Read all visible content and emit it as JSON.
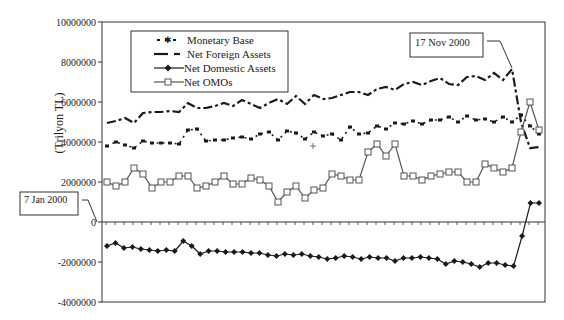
{
  "chart_data": {
    "type": "line",
    "title": "",
    "xlabel": "",
    "ylabel": "(Trilyon TL)",
    "ylim": [
      -4000000,
      10000000
    ],
    "y_ticks": [
      -4000000,
      -2000000,
      0,
      2000000,
      4000000,
      6000000,
      8000000,
      10000000
    ],
    "y_tick_labels": [
      "-4000000",
      "-2000000",
      "0",
      "2000000",
      "4000000",
      "6000000",
      "8000000",
      "10000000"
    ],
    "x_description": "Weekly observations, 7 Jan 2000 onward (no x tick labels shown)",
    "grid": false,
    "legend_position": "upper-left inside plot",
    "annotations": [
      {
        "text": "7 Jan 2000",
        "points_to": "start of series"
      },
      {
        "text": "17 Nov 2000",
        "points_to": "peak of Net Foreign Assets before collapse"
      }
    ],
    "series": [
      {
        "name": "Monetary Base",
        "style": "dash-dot with x markers",
        "values": [
          3800000,
          4000000,
          3850000,
          3700000,
          4050000,
          3950000,
          3950000,
          3950000,
          3900000,
          4600000,
          4650000,
          4050000,
          4100000,
          4100000,
          4200000,
          4250000,
          4150000,
          4400000,
          4500000,
          4100000,
          4550000,
          4450000,
          4150000,
          4500000,
          4300000,
          4400000,
          4100000,
          4750000,
          4400000,
          4450000,
          4800000,
          4650000,
          4950000,
          4900000,
          5050000,
          4900000,
          5100000,
          5100000,
          5250000,
          5000000,
          5300000,
          5100000,
          5150000,
          5000000,
          5250000,
          5000000,
          5350000,
          4800000,
          4400000
        ]
      },
      {
        "name": "Net Foreign Assets",
        "style": "long dash-short dash",
        "values": [
          4950000,
          5050000,
          5200000,
          4950000,
          5450000,
          5500000,
          5500000,
          5550000,
          5500000,
          5950000,
          5700000,
          5700000,
          5800000,
          5950000,
          5800000,
          6100000,
          5900000,
          5700000,
          5950000,
          6150000,
          5900000,
          6300000,
          5900000,
          6350000,
          6150000,
          6200000,
          6350000,
          6500000,
          6500000,
          6350000,
          6650000,
          6750000,
          6600000,
          6900000,
          7000000,
          6850000,
          7050000,
          7200000,
          6900000,
          6850000,
          7250000,
          7300000,
          7100000,
          7450000,
          7100000,
          7650000,
          5000000,
          3700000,
          3750000
        ]
      },
      {
        "name": "Net Domestic Assets",
        "style": "solid with diamond markers",
        "values": [
          -1200000,
          -1050000,
          -1300000,
          -1250000,
          -1350000,
          -1400000,
          -1450000,
          -1400000,
          -1450000,
          -950000,
          -1200000,
          -1600000,
          -1450000,
          -1450000,
          -1500000,
          -1500000,
          -1500000,
          -1550000,
          -1550000,
          -1650000,
          -1700000,
          -1600000,
          -1650000,
          -1600000,
          -1700000,
          -1750000,
          -1850000,
          -1800000,
          -1700000,
          -1750000,
          -1850000,
          -1750000,
          -1800000,
          -1800000,
          -1950000,
          -1800000,
          -1800000,
          -1750000,
          -1800000,
          -1850000,
          -2100000,
          -1950000,
          -2000000,
          -2100000,
          -2250000,
          -2050000,
          -2050000,
          -2150000,
          -2200000,
          -700000,
          950000,
          950000
        ]
      },
      {
        "name": "Net OMOs",
        "style": "solid with square markers",
        "values": [
          2000000,
          1800000,
          2000000,
          2700000,
          2400000,
          1700000,
          2000000,
          2000000,
          2300000,
          2300000,
          1700000,
          1800000,
          2000000,
          2300000,
          1900000,
          1900000,
          2200000,
          2100000,
          1800000,
          1000000,
          1500000,
          1800000,
          1200000,
          1600000,
          1700000,
          2400000,
          2300000,
          2100000,
          2100000,
          3500000,
          3900000,
          3300000,
          3900000,
          2300000,
          2300000,
          2100000,
          2300000,
          2400000,
          2500000,
          2500000,
          2000000,
          2000000,
          2900000,
          2700000,
          2500000,
          2700000,
          4500000,
          6000000,
          4600000
        ]
      }
    ]
  },
  "legend": {
    "items": [
      {
        "label": "Monetary Base"
      },
      {
        "label": "Net Foreign Assets"
      },
      {
        "label": "Net Domestic Assets"
      },
      {
        "label": "Net OMOs"
      }
    ]
  },
  "callouts": {
    "start": "7 Jan 2000",
    "peak": "17 Nov 2000"
  },
  "colors": {
    "line": "#1a1a1a",
    "axis": "#333333",
    "omo_marker_fill": "#ffffff"
  }
}
